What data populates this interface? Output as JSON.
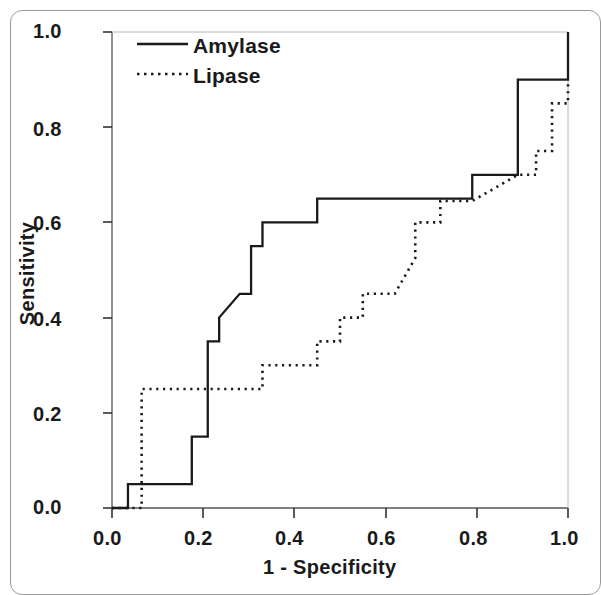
{
  "chart_data": {
    "type": "line",
    "title": "",
    "subtitle": "",
    "xlabel": "1 - Specificity",
    "ylabel": "Sensitivity",
    "xlim": [
      0.0,
      1.0
    ],
    "ylim": [
      0.0,
      1.0
    ],
    "xticks": [
      "0.0",
      "0.2",
      "0.4",
      "0.6",
      "0.8",
      "1.0"
    ],
    "xtick_values": [
      0.0,
      0.2,
      0.4,
      0.6,
      0.8,
      1.0
    ],
    "yticks": [
      "0.0",
      "0.2",
      "0.4",
      "0.6",
      "0.8",
      "1.0"
    ],
    "ytick_values": [
      0.0,
      0.2,
      0.4,
      0.6,
      0.8,
      1.0
    ],
    "grid": false,
    "legend_position": "top-left-inside",
    "annotations": [],
    "series": [
      {
        "name": "Amylase",
        "style": "solid",
        "color": "#1a1a1a",
        "x": [
          0.0,
          0.035,
          0.035,
          0.175,
          0.175,
          0.21,
          0.21,
          0.235,
          0.235,
          0.28,
          0.305,
          0.305,
          0.33,
          0.33,
          0.45,
          0.45,
          0.79,
          0.79,
          0.89,
          0.89,
          1.0,
          1.0
        ],
        "y": [
          0.0,
          0.0,
          0.05,
          0.05,
          0.15,
          0.15,
          0.35,
          0.35,
          0.4,
          0.45,
          0.45,
          0.55,
          0.55,
          0.6,
          0.6,
          0.65,
          0.65,
          0.7,
          0.7,
          0.9,
          0.9,
          1.0
        ]
      },
      {
        "name": "Lipase",
        "style": "dotted",
        "color": "#1a1a1a",
        "x": [
          0.0,
          0.065,
          0.065,
          0.33,
          0.33,
          0.45,
          0.45,
          0.5,
          0.5,
          0.55,
          0.55,
          0.62,
          0.665,
          0.665,
          0.72,
          0.72,
          0.79,
          0.845,
          0.89,
          0.93,
          0.93,
          0.965,
          0.965,
          1.0,
          1.0
        ],
        "y": [
          0.0,
          0.0,
          0.25,
          0.25,
          0.3,
          0.3,
          0.35,
          0.35,
          0.4,
          0.4,
          0.45,
          0.45,
          0.525,
          0.6,
          0.6,
          0.645,
          0.645,
          0.675,
          0.7,
          0.7,
          0.75,
          0.75,
          0.85,
          0.85,
          0.9
        ]
      }
    ]
  },
  "legend": {
    "entries": [
      {
        "label": "Amylase",
        "style": "solid"
      },
      {
        "label": "Lipase",
        "style": "dotted"
      }
    ]
  },
  "axes": {
    "x_title": "1 - Specificity",
    "y_title": "Sensitivity"
  }
}
